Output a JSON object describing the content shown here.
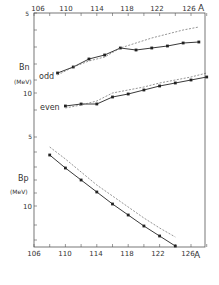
{
  "chart_data": {
    "type": "line",
    "title": "",
    "xlabel": "A",
    "x_ticks": [
      106,
      110,
      114,
      118,
      122,
      126
    ],
    "x_minor_step": 2,
    "xlim": [
      106,
      128
    ],
    "panels": [
      {
        "name": "upper",
        "ylabel": "Bn",
        "yunit": "(MeV)",
        "y_tick_labels": [
          "5",
          "10"
        ],
        "series": [
          {
            "name": "odd",
            "style": "solid-markers",
            "x": [
              109,
              111,
              113,
              115,
              117,
              119,
              121,
              123,
              125,
              127
            ],
            "y_px": [
              73,
              67,
              59,
              55,
              48,
              50,
              48,
              46,
              43,
              42
            ]
          },
          {
            "name": "odd-calc",
            "style": "dashed",
            "x": [
              109,
              111,
              113,
              115,
              117,
              119,
              121,
              123,
              125,
              127
            ],
            "y_px": [
              75,
              67,
              61,
              57,
              48,
              43,
              38,
              34,
              30,
              27
            ]
          },
          {
            "name": "even",
            "style": "solid-markers",
            "x": [
              110,
              112,
              114,
              116,
              118,
              120,
              122,
              124,
              126,
              128
            ],
            "y_px": [
              106,
              104,
              104,
              97,
              94,
              90,
              86,
              83,
              80,
              77
            ]
          },
          {
            "name": "even-calc",
            "style": "dashed",
            "x": [
              110,
              112,
              114,
              116,
              118,
              120,
              122,
              124,
              126,
              128
            ],
            "y_px": [
              108,
              105,
              101,
              93,
              90,
              87,
              83,
              80,
              77,
              73
            ]
          }
        ],
        "labels": {
          "odd": "odd",
          "even": "even"
        }
      },
      {
        "name": "lower",
        "ylabel": "Bp",
        "yunit": "(MeV)",
        "y_tick_labels": [
          "5",
          "10"
        ],
        "series": [
          {
            "name": "Bp-exp",
            "style": "solid-markers",
            "x": [
              108,
              110,
              112,
              114,
              116,
              118,
              120,
              122,
              124
            ],
            "y_px": [
              155,
              168,
              180,
              192,
              204,
              215,
              226,
              236,
              246
            ]
          },
          {
            "name": "Bp-calc",
            "style": "dashed",
            "x": [
              108,
              110,
              112,
              114,
              116,
              118,
              120,
              122,
              124
            ],
            "y_px": [
              147,
              159,
              172,
              185,
              196,
              207,
              218,
              228,
              237
            ]
          }
        ]
      }
    ]
  },
  "labels": {
    "top_x_ticks": [
      "106",
      "110",
      "114",
      "118",
      "122",
      "126"
    ],
    "bottom_x_ticks": [
      "106",
      "110",
      "114",
      "118",
      "122",
      "126"
    ],
    "axis_A_top": "A",
    "axis_A_bottom": "A",
    "upper_y_5": "5",
    "upper_y_10": "10",
    "lower_y_5": "5",
    "lower_y_10": "10",
    "bn": "Bn",
    "bn_sub": "n",
    "bp": "Bp",
    "bp_sub": "p",
    "mev_upper": "(MeV)",
    "mev_lower": "(MeV)",
    "odd": "odd",
    "even": "even"
  },
  "colors": {
    "line": "#222222",
    "axis": "#555555",
    "dashed": "#666666"
  }
}
